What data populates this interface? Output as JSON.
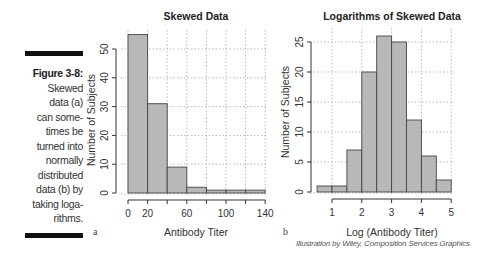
{
  "caption": {
    "figure_label": "Figure 3-8:",
    "lines": [
      "Skewed",
      "data (a)",
      "can some-",
      "times be",
      "turned into",
      "normally",
      "distributed",
      "data (b) by",
      "taking loga-",
      "rithms."
    ]
  },
  "panel_labels": {
    "a": "a",
    "b": "b"
  },
  "credit": "Illustration by Wiley, Composition Services Graphics",
  "colors": {
    "bar_fill": "#b8b8b8",
    "bar_stroke": "#444444",
    "grid": "#aaaaaa",
    "text": "#333333"
  },
  "chart_data": [
    {
      "type": "bar",
      "title": "Skewed Data",
      "xlabel": "Antibody Titer",
      "ylabel": "Number of Subjects",
      "bins": [
        [
          0,
          20
        ],
        [
          20,
          40
        ],
        [
          40,
          60
        ],
        [
          60,
          80
        ],
        [
          80,
          100
        ],
        [
          100,
          120
        ],
        [
          120,
          140
        ]
      ],
      "values": [
        55,
        31,
        9,
        2,
        1,
        1,
        1
      ],
      "xticks": [
        0,
        20,
        60,
        100,
        140
      ],
      "yticks": [
        0,
        10,
        20,
        30,
        40,
        50
      ],
      "xlim": [
        0,
        140
      ],
      "ylim": [
        0,
        55
      ],
      "grid": true
    },
    {
      "type": "bar",
      "title": "Logarithms of Skewed Data",
      "xlabel": "Log (Antibody Titer)",
      "ylabel": "Number of Subjects",
      "bins": [
        [
          0.5,
          1
        ],
        [
          1,
          1.5
        ],
        [
          1.5,
          2
        ],
        [
          2,
          2.5
        ],
        [
          2.5,
          3
        ],
        [
          3,
          3.5
        ],
        [
          3.5,
          4
        ],
        [
          4,
          4.5
        ],
        [
          4.5,
          5
        ]
      ],
      "values": [
        1,
        1,
        7,
        20,
        26,
        25,
        12,
        6,
        2
      ],
      "xticks": [
        1,
        2,
        3,
        4,
        5
      ],
      "yticks": [
        0,
        5,
        10,
        15,
        20,
        25
      ],
      "xlim": [
        0.5,
        5
      ],
      "ylim": [
        0,
        26
      ],
      "grid": true
    }
  ]
}
